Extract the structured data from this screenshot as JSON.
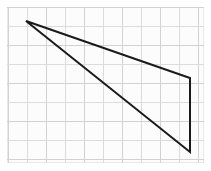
{
  "figure": {
    "description": "A thin black triangle drawn on a light gray square grid. Its apex is at the upper left and its vertical side lies along the right edge of the grid.",
    "canvas": {
      "width": 211,
      "height": 171,
      "background_color": "#ffffff"
    },
    "panel": {
      "x": 7,
      "y": 7,
      "width": 197,
      "height": 156,
      "fill_color": "#fcfcfc",
      "border_color": "#e9e9e9"
    },
    "grid": {
      "spacing": 19,
      "origin_x": 8,
      "origin_y": 7,
      "line_color": "#dcdcdc",
      "major_line_color": "#d2d2d2",
      "visible": true,
      "vertical_line_positions": [
        8,
        27,
        46,
        65,
        84,
        103,
        122,
        141,
        160,
        179,
        198
      ],
      "horizontal_line_positions": [
        7,
        26,
        45,
        64,
        83,
        102,
        121,
        140,
        159
      ]
    },
    "shape": {
      "name": "triangle",
      "stroke_color": "#1a1a1a",
      "stroke_width": 2,
      "fill_color": "none",
      "closed": true,
      "vertices": [
        {
          "label": "apex-top-left",
          "x": 26,
          "y": 21
        },
        {
          "label": "right-upper",
          "x": 190,
          "y": 78
        },
        {
          "label": "right-lower",
          "x": 190,
          "y": 152
        }
      ],
      "edges": [
        {
          "label": "upper-edge",
          "from": "apex-top-left",
          "to": "right-upper"
        },
        {
          "label": "right-vertical-edge",
          "from": "right-upper",
          "to": "right-lower"
        },
        {
          "label": "lower-edge",
          "from": "right-lower",
          "to": "apex-top-left"
        }
      ],
      "path": "M 26 21 L 190 78 L 190 152 Z"
    }
  }
}
